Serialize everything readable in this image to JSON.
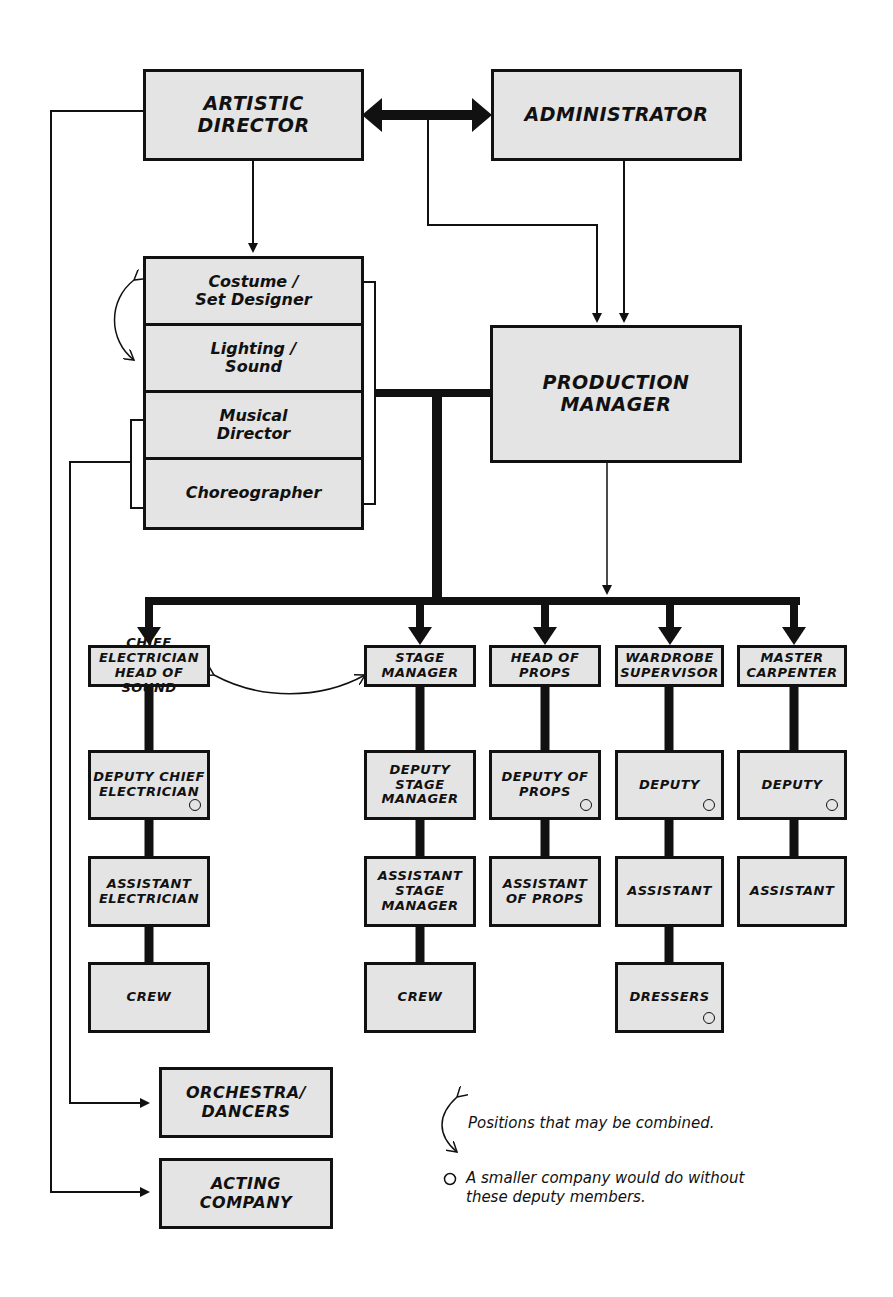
{
  "nodes": {
    "artistic_director": "Artistic\nDirector",
    "administrator": "Administrator",
    "production_manager": "Production\nManager",
    "creative_team": [
      "Costume /\nSet Designer",
      "Lighting /\nSound",
      "Musical\nDirector",
      "Choreographer"
    ],
    "orchestra_dancers": "Orchestra/\nDancers",
    "acting_company": "Acting\nCompany"
  },
  "departments": [
    {
      "head": "Chief\nElectrician\nHead of Sound",
      "chain": [
        {
          "label": "Deputy Chief\nElectrician",
          "optional": true
        },
        {
          "label": "Assistant\nElectrician",
          "optional": false
        },
        {
          "label": "Crew",
          "optional": false
        }
      ]
    },
    {
      "head": "Stage\nManager",
      "chain": [
        {
          "label": "Deputy\nStage\nManager",
          "optional": false
        },
        {
          "label": "Assistant\nStage\nManager",
          "optional": false
        },
        {
          "label": "Crew",
          "optional": false
        }
      ]
    },
    {
      "head": "Head of\nProps",
      "chain": [
        {
          "label": "Deputy of\nProps",
          "optional": true
        },
        {
          "label": "Assistant\nof Props",
          "optional": false
        }
      ]
    },
    {
      "head": "Wardrobe\nSupervisor",
      "chain": [
        {
          "label": "Deputy",
          "optional": true
        },
        {
          "label": "Assistant",
          "optional": false
        },
        {
          "label": "Dressers",
          "optional": true
        }
      ]
    },
    {
      "head": "Master\nCarpenter",
      "chain": [
        {
          "label": "Deputy",
          "optional": true
        },
        {
          "label": "Assistant",
          "optional": false
        }
      ]
    }
  ],
  "legend": {
    "combined": "Positions that may be combined.",
    "optional": "A smaller company would do without these deputy members."
  },
  "colors": {
    "box_fill": "#e4e4e4",
    "line": "#111111",
    "background": "#ffffff"
  }
}
